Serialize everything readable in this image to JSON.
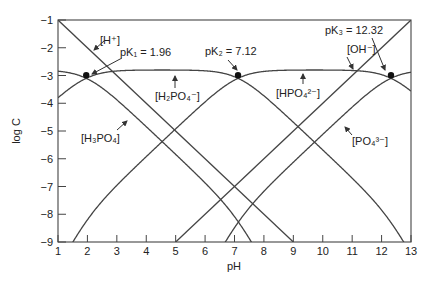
{
  "chart_data": {
    "type": "line",
    "title": "",
    "xlabel": "pH",
    "ylabel": "log C",
    "xlim": [
      1,
      13
    ],
    "ylim": [
      -9,
      -1
    ],
    "xticks": [
      1,
      2,
      3,
      4,
      5,
      6,
      7,
      8,
      9,
      10,
      11,
      12,
      13
    ],
    "yticks": [
      -1,
      -2,
      -3,
      -4,
      -5,
      -6,
      -7,
      -8,
      -9
    ],
    "grid": false,
    "legend": "none (inline labels)",
    "total_log_concentration": -2.8,
    "pK": {
      "pK1": 1.96,
      "pK2": 7.12,
      "pK3": 12.32
    },
    "series": [
      {
        "name": "[H+]",
        "description": "log[H+] = -pH"
      },
      {
        "name": "[OH-]",
        "description": "log[OH-] = pH - 14"
      },
      {
        "name": "[H3PO4]"
      },
      {
        "name": "[H2PO4-]"
      },
      {
        "name": "[HPO4 2-]"
      },
      {
        "name": "[PO4 3-]"
      }
    ],
    "annotations": [
      {
        "text": "pK1 = 1.96",
        "point": [
          1.96,
          -3.1
        ]
      },
      {
        "text": "pK2 = 7.12",
        "point": [
          7.12,
          -3.1
        ]
      },
      {
        "text": "pK3 = 12.32",
        "point": [
          12.32,
          -3.1
        ]
      }
    ]
  },
  "labels": {
    "xlabel": "pH",
    "ylabel": "log C",
    "H": "[H⁺]",
    "OH": "[OH⁻]",
    "H3PO4": "[H₃PO₄]",
    "H2PO4": "[H₂PO₄⁻]",
    "HPO4": "[HPO₄²⁻]",
    "PO4": "[PO₄³⁻]",
    "pK1": "pK₁ = 1.96",
    "pK2": "pK₂ = 7.12",
    "pK3": "pK₃ = 12.32"
  }
}
